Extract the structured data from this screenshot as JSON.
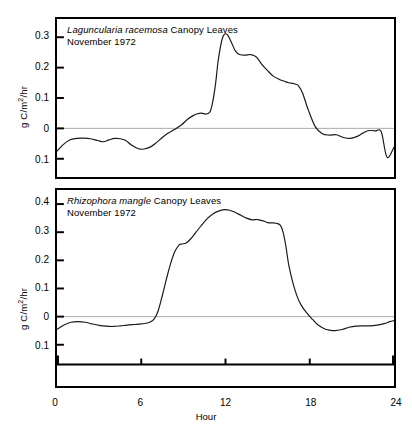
{
  "figure": {
    "xlabel": "Hour",
    "ylabel_prefix": "g C/m",
    "ylabel_sup": "2",
    "ylabel_suffix": "/hr",
    "xticks": [
      "0",
      "6",
      "12",
      "18",
      "24"
    ],
    "xtick_values": [
      0,
      6,
      12,
      18,
      24
    ],
    "line_color": "#1a1a1a",
    "zero_line_color": "#aaaaaa",
    "frame_color": "#000000"
  },
  "chart_data": [
    {
      "type": "line",
      "panel": "top",
      "title_species": "Laguncularia racemosa",
      "title_rest": " Canopy Leaves",
      "title_date": "November 1972",
      "xlabel": "Hour",
      "ylabel": "g C/m2/hr",
      "xlim": [
        0,
        24
      ],
      "ylim": [
        -0.16,
        0.36
      ],
      "yticks": [
        0.3,
        0.2,
        0.1,
        0,
        -0.1
      ],
      "ytick_labels": [
        "0.3",
        "0.2",
        "0.1",
        "0",
        "0.1"
      ],
      "grid": false,
      "legend": "none",
      "zero_reference_line": 0,
      "x": [
        0,
        0.4,
        0.9,
        1.4,
        1.9,
        2.4,
        2.9,
        3.3,
        3.7,
        4.1,
        4.5,
        4.9,
        5.3,
        5.8,
        6.2,
        6.7,
        7.1,
        7.5,
        7.9,
        8.4,
        8.9,
        9.3,
        9.7,
        10.0,
        10.3,
        10.6,
        10.9,
        11.1,
        11.3,
        11.5,
        11.8,
        12.1,
        12.4,
        12.7,
        13.0,
        13.4,
        13.8,
        14.2,
        14.6,
        15.0,
        15.4,
        15.8,
        16.2,
        16.5,
        16.8,
        17.0,
        17.2,
        17.5,
        17.9,
        18.4,
        18.9,
        19.4,
        19.9,
        20.4,
        20.9,
        21.3,
        21.7,
        22.0,
        22.3,
        22.7,
        23.1,
        23.5,
        24.0
      ],
      "y": [
        -0.075,
        -0.055,
        -0.038,
        -0.033,
        -0.032,
        -0.034,
        -0.04,
        -0.044,
        -0.038,
        -0.033,
        -0.034,
        -0.04,
        -0.055,
        -0.067,
        -0.068,
        -0.06,
        -0.046,
        -0.03,
        -0.016,
        -0.003,
        0.013,
        0.03,
        0.042,
        0.048,
        0.05,
        0.047,
        0.055,
        0.09,
        0.15,
        0.23,
        0.3,
        0.31,
        0.285,
        0.255,
        0.243,
        0.241,
        0.243,
        0.235,
        0.21,
        0.19,
        0.172,
        0.162,
        0.155,
        0.15,
        0.148,
        0.145,
        0.14,
        0.115,
        0.06,
        0.005,
        -0.018,
        -0.022,
        -0.021,
        -0.03,
        -0.033,
        -0.028,
        -0.018,
        -0.01,
        -0.007,
        -0.008,
        -0.012,
        -0.095,
        -0.062
      ]
    },
    {
      "type": "line",
      "panel": "bottom",
      "title_species": "Rhizophora mangle",
      "title_rest": " Canopy Leaves",
      "title_date": "November 1972",
      "xlabel": "Hour",
      "ylabel": "g C/m2/hr",
      "xlim": [
        0,
        24
      ],
      "ylim": [
        -0.17,
        0.45
      ],
      "yticks": [
        0.4,
        0.3,
        0.2,
        0.1,
        0,
        -0.1
      ],
      "ytick_labels": [
        "0.4",
        "0.3",
        "0.2",
        "0.1",
        "0",
        "0.1"
      ],
      "grid": false,
      "legend": "none",
      "zero_reference_line": 0,
      "x": [
        0,
        0.5,
        1.0,
        1.5,
        2.0,
        2.5,
        3.0,
        3.5,
        4.0,
        4.5,
        5.0,
        5.5,
        6.0,
        6.5,
        6.9,
        7.2,
        7.5,
        7.8,
        8.1,
        8.4,
        8.7,
        8.9,
        9.2,
        9.5,
        9.9,
        10.3,
        10.7,
        11.1,
        11.5,
        11.9,
        12.3,
        12.7,
        13.1,
        13.5,
        13.9,
        14.3,
        14.7,
        15.0,
        15.3,
        15.6,
        15.9,
        16.1,
        16.3,
        16.5,
        16.8,
        17.1,
        17.4,
        17.8,
        18.2,
        18.6,
        19.0,
        19.4,
        19.8,
        20.3,
        20.8,
        21.3,
        21.8,
        22.3,
        22.8,
        23.3,
        23.7,
        24.0
      ],
      "y": [
        -0.045,
        -0.03,
        -0.02,
        -0.018,
        -0.02,
        -0.026,
        -0.031,
        -0.034,
        -0.035,
        -0.033,
        -0.03,
        -0.028,
        -0.026,
        -0.022,
        -0.01,
        0.02,
        0.075,
        0.135,
        0.19,
        0.232,
        0.255,
        0.258,
        0.262,
        0.275,
        0.3,
        0.325,
        0.348,
        0.365,
        0.375,
        0.38,
        0.378,
        0.37,
        0.36,
        0.35,
        0.344,
        0.345,
        0.34,
        0.334,
        0.333,
        0.332,
        0.325,
        0.3,
        0.25,
        0.185,
        0.12,
        0.072,
        0.04,
        0.012,
        -0.01,
        -0.03,
        -0.042,
        -0.048,
        -0.05,
        -0.046,
        -0.038,
        -0.034,
        -0.033,
        -0.033,
        -0.03,
        -0.025,
        -0.018,
        -0.014
      ]
    }
  ]
}
